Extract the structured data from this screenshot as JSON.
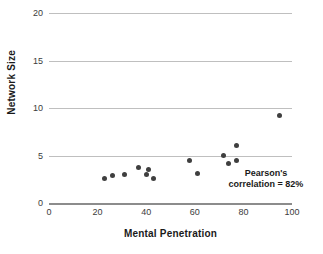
{
  "chart_data": {
    "type": "scatter",
    "title": "",
    "xlabel": "Mental Penetration",
    "ylabel": "Network Size",
    "xlim": [
      0,
      100
    ],
    "ylim": [
      0,
      20
    ],
    "xticks": [
      "0",
      "20",
      "40",
      "60",
      "80",
      "100"
    ],
    "xtick_values": [
      0,
      20,
      40,
      60,
      80,
      100
    ],
    "yticks": [
      "0",
      "5",
      "10",
      "15",
      "20"
    ],
    "ytick_values": [
      0,
      5,
      10,
      15,
      20
    ],
    "grid": "horizontal",
    "legend": "none",
    "marker_color": "#3f3f3f",
    "gridline_color": "#bfbfbf",
    "axis_color": "#8c8c8c",
    "annotations": [
      {
        "line1": "Pearson's",
        "line2": "correlation = 82%"
      }
    ],
    "points": [
      {
        "x": 23,
        "y": 2.6
      },
      {
        "x": 26,
        "y": 2.85
      },
      {
        "x": 31,
        "y": 3.0
      },
      {
        "x": 37,
        "y": 3.75
      },
      {
        "x": 40,
        "y": 3.0
      },
      {
        "x": 41,
        "y": 3.55
      },
      {
        "x": 43,
        "y": 2.6
      },
      {
        "x": 58,
        "y": 4.45
      },
      {
        "x": 61,
        "y": 3.1
      },
      {
        "x": 72,
        "y": 5.0
      },
      {
        "x": 74,
        "y": 4.2
      },
      {
        "x": 77,
        "y": 6.1
      },
      {
        "x": 77,
        "y": 4.45
      },
      {
        "x": 95,
        "y": 9.2
      }
    ]
  }
}
